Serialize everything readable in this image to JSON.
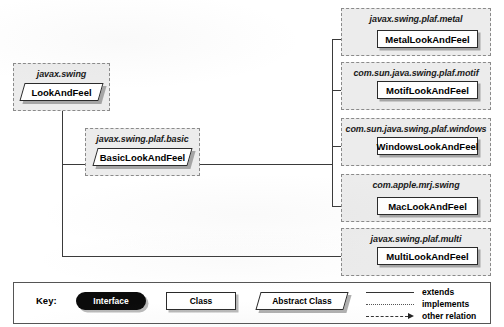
{
  "diagram": {
    "packages": [
      {
        "id": "pkg-javax-swing",
        "package_label": "javax.swing",
        "class_name": "LookAndFeel",
        "class_kind": "Abstract Class"
      },
      {
        "id": "pkg-javax-swing-plaf-basic",
        "package_label": "javax.swing.plaf.basic",
        "class_name": "BasicLookAndFeel",
        "class_kind": "Abstract Class"
      },
      {
        "id": "pkg-javax-swing-plaf-metal",
        "package_label": "javax.swing.plaf.metal",
        "class_name": "MetalLookAndFeel",
        "class_kind": "Class"
      },
      {
        "id": "pkg-com-sun-java-swing-plaf-motif",
        "package_label": "com.sun.java.swing.plaf.motif",
        "class_name": "MotifLookAndFeel",
        "class_kind": "Class"
      },
      {
        "id": "pkg-com-sun-java-swing-plaf-windows",
        "package_label": "com.sun.java.swing.plaf.windows",
        "class_name": "WindowsLookAndFeel",
        "class_kind": "Class"
      },
      {
        "id": "pkg-com-apple-mrj-swing",
        "package_label": "com.apple.mrj.swing",
        "class_name": "MacLookAndFeel",
        "class_kind": "Class"
      },
      {
        "id": "pkg-javax-swing-plaf-multi",
        "package_label": "javax.swing.plaf.multi",
        "class_name": "MultiLookAndFeel",
        "class_kind": "Class"
      }
    ]
  },
  "legend": {
    "key_label": "Key:",
    "interface_label": "Interface",
    "class_label": "Class",
    "abstract_class_label": "Abstract Class",
    "relations": [
      {
        "label": "extends",
        "style": "solid"
      },
      {
        "label": "implements",
        "style": "dotted"
      },
      {
        "label": "other relation",
        "style": "dashed-arrow"
      }
    ]
  },
  "colors": {
    "package_fill": "#ececec",
    "package_border": "#8a8a8a",
    "class_fill": "#ffffff",
    "class_border": "#2a2a2a",
    "interface_fill": "#0b0b0b",
    "line": "#3a3a3a",
    "text": "#000000"
  }
}
